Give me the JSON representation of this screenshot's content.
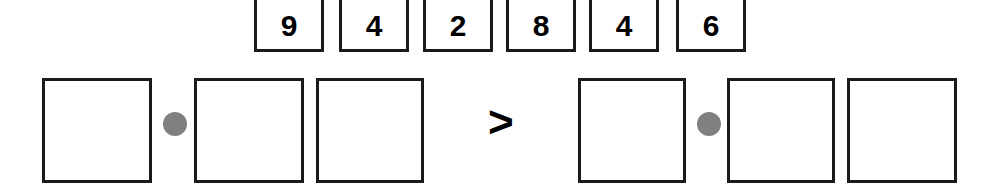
{
  "worksheet": {
    "width": 990,
    "height": 195,
    "background_color": "#ffffff",
    "stroke_color": "#1a1a1a",
    "dot_color": "#808080",
    "text_color": "#000000"
  },
  "digit_bank": {
    "name": "digit-tiles",
    "tiles": [
      {
        "value": "9",
        "x": 254,
        "y": -6,
        "w": 70,
        "h": 58
      },
      {
        "value": "4",
        "x": 339,
        "y": -6,
        "w": 70,
        "h": 58
      },
      {
        "value": "2",
        "x": 423,
        "y": -6,
        "w": 70,
        "h": 58
      },
      {
        "value": "8",
        "x": 506,
        "y": -6,
        "w": 70,
        "h": 58
      },
      {
        "value": "4",
        "x": 589,
        "y": -6,
        "w": 70,
        "h": 58
      },
      {
        "value": "6",
        "x": 676,
        "y": -6,
        "w": 70,
        "h": 58
      }
    ]
  },
  "expression": {
    "comparison_symbol": ">",
    "comparison_x": 488,
    "comparison_y": 100,
    "left_side": {
      "boxes": [
        {
          "value": "",
          "x": 42,
          "y": 78,
          "w": 110,
          "h": 105
        },
        {
          "value": "",
          "x": 194,
          "y": 78,
          "w": 110,
          "h": 105
        },
        {
          "value": "",
          "x": 316,
          "y": 78,
          "w": 108,
          "h": 105
        }
      ],
      "operator_dot": {
        "x": 163,
        "y": 112,
        "size": 24
      }
    },
    "right_side": {
      "boxes": [
        {
          "value": "",
          "x": 578,
          "y": 78,
          "w": 108,
          "h": 105
        },
        {
          "value": "",
          "x": 727,
          "y": 78,
          "w": 108,
          "h": 105
        },
        {
          "value": "",
          "x": 847,
          "y": 78,
          "w": 110,
          "h": 105
        }
      ],
      "operator_dot": {
        "x": 697,
        "y": 112,
        "size": 24
      }
    }
  }
}
